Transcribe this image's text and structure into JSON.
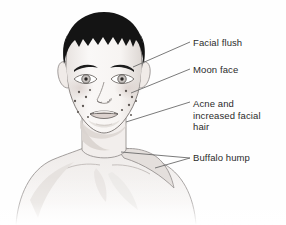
{
  "figure": {
    "name": "cushings-syndrome-facial-features-illustration",
    "background_color": "#fefefe"
  },
  "illustration": {
    "hair_color": "#141414",
    "skin_color": "#f7f5f4",
    "outline_color": "#6e6a68",
    "shadow_color": "#cfcac7",
    "acne_spot_color": "#5d5753",
    "acne_spot_count": 14,
    "features": [
      "dark-short-hair",
      "rounded-moon-face",
      "eyebrows",
      "eyes",
      "nose",
      "mouth",
      "chin",
      "neck",
      "shoulders",
      "upper-back-hump"
    ]
  },
  "leaders": {
    "color": "#6b6b6b",
    "width": 0.9,
    "lines": [
      {
        "name": "facial-flush-leader",
        "x1": 133,
        "y1": 67,
        "x2": 190,
        "y2": 42
      },
      {
        "name": "moon-face-leader",
        "x1": 131,
        "y1": 93,
        "x2": 190,
        "y2": 69
      },
      {
        "name": "acne-leader",
        "x1": 126,
        "y1": 122,
        "x2": 190,
        "y2": 102
      },
      {
        "name": "buffalo-hump-leader-upper",
        "x1": 121,
        "y1": 152,
        "x2": 190,
        "y2": 158
      },
      {
        "name": "buffalo-hump-leader-lower",
        "x1": 155,
        "y1": 168,
        "x2": 190,
        "y2": 158
      }
    ]
  },
  "labels": {
    "facial_flush": "Facial flush",
    "moon_face": "Moon face",
    "acne_and_hair": "Acne and\nincreased facial\nhair",
    "buffalo_hump": "Buffalo hump"
  }
}
